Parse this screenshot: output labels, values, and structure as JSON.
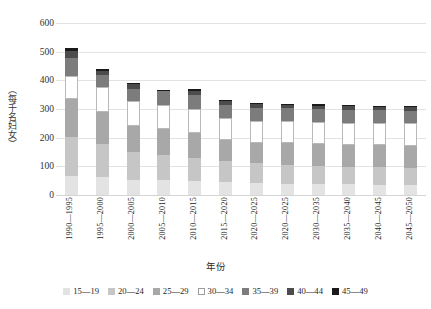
{
  "chart_data": {
    "type": "bar",
    "subtype": "stacked-bar",
    "title": "",
    "xlabel": "年份",
    "ylabel": "（每千名妇女）",
    "ylim": [
      0,
      600
    ],
    "ytick_step": 100,
    "yticks": [
      "0",
      "100",
      "200",
      "300",
      "400",
      "500",
      "600"
    ],
    "grid": true,
    "legend_position": "bottom",
    "categories": [
      "1990—1995",
      "1995—2000",
      "2000—2005",
      "2005—2010",
      "2010—2015",
      "2015—2020",
      "2020—2025",
      "2020—2025",
      "2030—2035",
      "2035—2040",
      "2040—2045",
      "2045—2050"
    ],
    "series": [
      {
        "name": "15—19",
        "color": "#e3e3e3",
        "values": [
          68,
          64,
          52,
          52,
          50,
          46,
          42,
          40,
          38,
          37,
          36,
          35
        ]
      },
      {
        "name": "20—24",
        "color": "#c6c6c6",
        "values": [
          133,
          113,
          98,
          86,
          80,
          72,
          68,
          65,
          63,
          62,
          61,
          60
        ]
      },
      {
        "name": "25—29",
        "color": "#a8a8a8",
        "values": [
          133,
          111,
          91,
          91,
          88,
          74,
          72,
          75,
          76,
          76,
          76,
          77
        ]
      },
      {
        "name": "30—34",
        "color": "#ffffff",
        "values": [
          82,
          90,
          86,
          84,
          82,
          78,
          78,
          78,
          78,
          78,
          78,
          78
        ]
      },
      {
        "name": "35—39",
        "color": "#7c7c7c",
        "values": [
          61,
          42,
          43,
          50,
          50,
          45,
          44,
          44,
          44,
          44,
          44,
          44
        ]
      },
      {
        "name": "40—44",
        "color": "#4c4c4c",
        "values": [
          26,
          14,
          16,
          0,
          14,
          13,
          12,
          12,
          12,
          12,
          12,
          12
        ]
      },
      {
        "name": "45—49",
        "color": "#1a1a1a",
        "values": [
          9,
          6,
          5,
          2,
          5,
          5,
          5,
          5,
          5,
          5,
          5,
          5
        ]
      }
    ],
    "totals": [
      512,
      440,
      391,
      380,
      369,
      326,
      315,
      314,
      313,
      313,
      312,
      311
    ]
  },
  "legend": {
    "items": [
      {
        "label": "15—19"
      },
      {
        "label": "20—24"
      },
      {
        "label": "25—29"
      },
      {
        "label": "30—34"
      },
      {
        "label": "35—39"
      },
      {
        "label": "40—44"
      },
      {
        "label": "45—49"
      }
    ]
  }
}
